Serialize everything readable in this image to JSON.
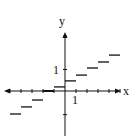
{
  "chart_data": {
    "type": "line",
    "title": "",
    "xlabel": "x",
    "ylabel": "y",
    "tick_labels": {
      "x": "1",
      "y": "1"
    },
    "xlim": [
      -2.5,
      2.5
    ],
    "ylim": [
      -2,
      2.6
    ],
    "grid": false,
    "legend": null,
    "segments": [
      {
        "x_start": -2.5,
        "x_end": -2.0,
        "y": -1.07
      },
      {
        "x_start": -2.0,
        "x_end": -1.5,
        "y": -0.74
      },
      {
        "x_start": -1.5,
        "x_end": -1.0,
        "y": -0.42
      },
      {
        "x_start": -1.0,
        "x_end": -0.5,
        "y": 0.0
      },
      {
        "x_start": -0.5,
        "x_end": 0.0,
        "y": 0.19
      },
      {
        "x_start": 0.0,
        "x_end": 0.5,
        "y": 0.47
      },
      {
        "x_start": 0.5,
        "x_end": 1.0,
        "y": 0.74
      },
      {
        "x_start": 1.0,
        "x_end": 1.5,
        "y": 1.07
      },
      {
        "x_start": 1.5,
        "x_end": 2.0,
        "y": 1.35
      },
      {
        "x_start": 2.0,
        "x_end": 2.5,
        "y": 1.67
      }
    ]
  },
  "layout": {
    "origin_px": [
      65,
      91
    ],
    "x_unit_px": 22,
    "y_unit_px": 21.5,
    "color": "#111111"
  }
}
